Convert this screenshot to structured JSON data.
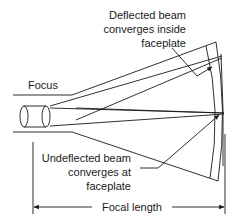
{
  "diagram": {
    "labels": {
      "deflected": [
        "Deflected beam",
        "converges inside",
        "faceplate"
      ],
      "focus": "Focus",
      "undeflected": [
        "Undeflected beam",
        "converges at",
        "faceplate"
      ],
      "focal_length": "Focal length"
    },
    "colors": {
      "line": "#1a1a1a",
      "background": "#ffffff"
    }
  }
}
